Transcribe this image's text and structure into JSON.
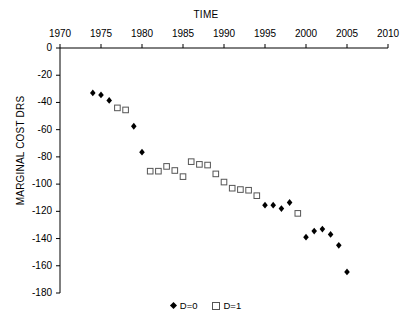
{
  "chart_data": {
    "type": "scatter",
    "title": "TIME",
    "xlabel": "TIME",
    "ylabel": "MARGINAL COST DRS",
    "xlim": [
      1970,
      2010
    ],
    "ylim": [
      -180,
      0
    ],
    "xticks": [
      1970,
      1975,
      1980,
      1985,
      1990,
      1995,
      2000,
      2005,
      2010
    ],
    "yticks": [
      0,
      -20,
      -40,
      -60,
      -80,
      -100,
      -120,
      -140,
      -160,
      -180
    ],
    "grid": false,
    "legend_position": "bottom",
    "series": [
      {
        "name": "D=0",
        "marker": "filled-diamond",
        "color": "#000000",
        "points": [
          {
            "x": 1974,
            "y": -33
          },
          {
            "x": 1975,
            "y": -34.5
          },
          {
            "x": 1976,
            "y": -38.5
          },
          {
            "x": 1979,
            "y": -57.5
          },
          {
            "x": 1980,
            "y": -76.5
          },
          {
            "x": 1995,
            "y": -115.5
          },
          {
            "x": 1996,
            "y": -115.5
          },
          {
            "x": 1997,
            "y": -118
          },
          {
            "x": 1998,
            "y": -113.5
          },
          {
            "x": 2000,
            "y": -139
          },
          {
            "x": 2001,
            "y": -134.5
          },
          {
            "x": 2002,
            "y": -133
          },
          {
            "x": 2003,
            "y": -137
          },
          {
            "x": 2004,
            "y": -145
          },
          {
            "x": 2005,
            "y": -164.5
          }
        ]
      },
      {
        "name": "D=1",
        "marker": "open-square",
        "color": "#555555",
        "points": [
          {
            "x": 1977,
            "y": -44
          },
          {
            "x": 1978,
            "y": -45.5
          },
          {
            "x": 1981,
            "y": -90.5
          },
          {
            "x": 1982,
            "y": -90.5
          },
          {
            "x": 1983,
            "y": -87
          },
          {
            "x": 1984,
            "y": -90
          },
          {
            "x": 1985,
            "y": -94.5
          },
          {
            "x": 1986,
            "y": -83.5
          },
          {
            "x": 1987,
            "y": -85.5
          },
          {
            "x": 1988,
            "y": -86
          },
          {
            "x": 1989,
            "y": -92.5
          },
          {
            "x": 1990,
            "y": -98.5
          },
          {
            "x": 1991,
            "y": -103
          },
          {
            "x": 1992,
            "y": -104
          },
          {
            "x": 1993,
            "y": -104.5
          },
          {
            "x": 1994,
            "y": -108.5
          },
          {
            "x": 1999,
            "y": -121.5
          }
        ]
      }
    ]
  },
  "legend": {
    "entries": [
      {
        "label": "D=0"
      },
      {
        "label": "D=1"
      }
    ]
  },
  "axes": {
    "x_title": "TIME",
    "y_title": "MARGINAL COST DRS"
  }
}
